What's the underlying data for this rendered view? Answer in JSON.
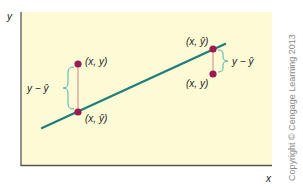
{
  "figure": {
    "y_axis_label": "y",
    "x_axis_label": "x",
    "copyright": "Copyright © Cengage Learning 2013",
    "colors": {
      "plot_background": "#fdfbd6",
      "regression_line": "#217d80",
      "points": "#9b1a4f",
      "connector": "#d98080",
      "brace": "#4fb3b0",
      "axes": "#555555"
    },
    "left_pair": {
      "observed_label": "(x, y)",
      "predicted_label": "(x, ŷ)",
      "residual_label": "y − ŷ"
    },
    "right_pair": {
      "predicted_label": "(x, ŷ)",
      "observed_label": "(x, y)",
      "residual_label": "y − ŷ"
    }
  }
}
